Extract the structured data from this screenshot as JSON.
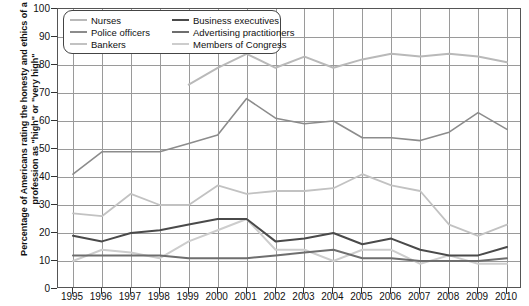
{
  "chart_data": {
    "type": "line",
    "title": "",
    "xlabel": "",
    "ylabel": "Percentage of Americans rating the honesty and ethics of a profession as \"high\" or \"very high\"",
    "ylim": [
      0,
      100
    ],
    "ytick_step": 10,
    "yticks": [
      0,
      10,
      20,
      30,
      40,
      50,
      60,
      70,
      80,
      90,
      100
    ],
    "grid": true,
    "legend_position": "top-left",
    "x": [
      1995,
      1996,
      1997,
      1998,
      1999,
      2000,
      2001,
      2002,
      2003,
      2004,
      2005,
      2006,
      2007,
      2008,
      2009,
      2010
    ],
    "xticklabels": [
      "1995",
      "1996",
      "1997",
      "1998",
      "1999",
      "2000",
      "2001",
      "2002",
      "2003",
      "2004",
      "2005",
      "2006",
      "2007",
      "2008",
      "2009",
      "2010"
    ],
    "series": [
      {
        "name": "Nurses",
        "color": "#b9b9b9",
        "width": 2.0,
        "x": [
          1999,
          2000,
          2001,
          2002,
          2003,
          2004,
          2005,
          2006,
          2007,
          2008,
          2009,
          2010
        ],
        "values": [
          73,
          79,
          84,
          79,
          83,
          79,
          82,
          84,
          83,
          84,
          83,
          81
        ]
      },
      {
        "name": "Police officers",
        "color": "#8c8c8c",
        "width": 1.6,
        "x": [
          1995,
          1996,
          1997,
          1998,
          1999,
          2000,
          2001,
          2002,
          2003,
          2004,
          2005,
          2006,
          2007,
          2008,
          2009,
          2010
        ],
        "values": [
          41,
          49,
          49,
          49,
          52,
          55,
          68,
          61,
          59,
          60,
          54,
          54,
          53,
          56,
          63,
          57
        ]
      },
      {
        "name": "Bankers",
        "color": "#c2c2c2",
        "width": 1.8,
        "x": [
          1995,
          1996,
          1997,
          1998,
          1999,
          2000,
          2001,
          2002,
          2003,
          2004,
          2005,
          2006,
          2007,
          2008,
          2009,
          2010
        ],
        "values": [
          27,
          26,
          34,
          30,
          30,
          37,
          34,
          35,
          35,
          36,
          41,
          37,
          35,
          23,
          19,
          23
        ]
      },
      {
        "name": "Business executives",
        "color": "#4a4a4a",
        "width": 2.0,
        "x": [
          1995,
          1996,
          1997,
          1998,
          1999,
          2000,
          2001,
          2002,
          2003,
          2004,
          2005,
          2006,
          2007,
          2008,
          2009,
          2010
        ],
        "values": [
          19,
          17,
          20,
          21,
          23,
          25,
          25,
          17,
          18,
          20,
          16,
          18,
          14,
          12,
          12,
          15
        ]
      },
      {
        "name": "Advertising practitioners",
        "color": "#6e6e6e",
        "width": 2.0,
        "x": [
          1995,
          1996,
          1997,
          1998,
          1999,
          2000,
          2001,
          2002,
          2003,
          2004,
          2005,
          2006,
          2007,
          2008,
          2009,
          2010
        ],
        "values": [
          12,
          12,
          12,
          12,
          11,
          11,
          11,
          12,
          13,
          14,
          11,
          11,
          10,
          10,
          10,
          11
        ]
      },
      {
        "name": "Members of Congress",
        "color": "#cdcdcd",
        "width": 2.0,
        "x": [
          1995,
          1996,
          1997,
          1998,
          1999,
          2000,
          2001,
          2002,
          2003,
          2004,
          2005,
          2006,
          2007,
          2008,
          2009,
          2010
        ],
        "values": [
          10,
          14,
          13,
          11,
          17,
          21,
          25,
          14,
          14,
          10,
          14,
          14,
          9,
          12,
          9,
          9
        ]
      }
    ],
    "legend": {
      "left_column": [
        "Nurses",
        "Police officers",
        "Bankers"
      ],
      "right_column": [
        "Business executives",
        "Advertising practitioners",
        "Members of Congress"
      ]
    }
  }
}
